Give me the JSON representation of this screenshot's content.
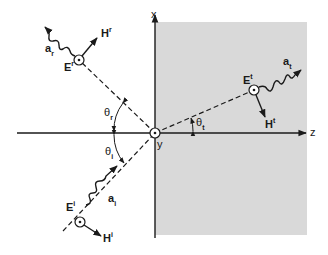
{
  "diagram": {
    "type": "oblique incidence at planar interface",
    "axes": {
      "x_label": "x",
      "y_label": "y",
      "z_label": "z"
    },
    "incident": {
      "E_label": "E",
      "E_sup": "i",
      "H_label": "H",
      "H_sup": "i",
      "a_label": "a",
      "a_sub": "i",
      "angle_label": "θ",
      "angle_sub": "i"
    },
    "reflected": {
      "E_label": "E",
      "E_sup": "r",
      "H_label": "H",
      "H_sup": "r",
      "a_label": "a",
      "a_sub": "r",
      "angle_label": "θ",
      "angle_sub": "r"
    },
    "transmitted": {
      "E_label": "E",
      "E_sup": "t",
      "H_label": "H",
      "H_sup": "t",
      "a_label": "a",
      "a_sub": "t",
      "angle_label": "θ",
      "angle_sub": "t"
    },
    "colors": {
      "medium2_fill": "#d9d9d9",
      "line": "#1a1a1a"
    }
  }
}
